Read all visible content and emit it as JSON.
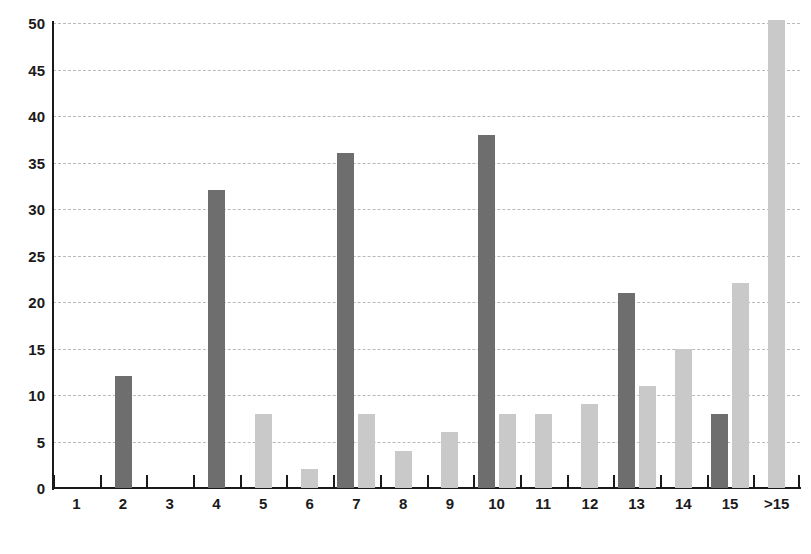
{
  "chart_data": {
    "type": "bar",
    "title": "",
    "subtitle": "",
    "xlabel": "",
    "ylabel": "",
    "xlim_categories": [
      "1",
      "2",
      "3",
      "4",
      "5",
      "6",
      "7",
      "8",
      "9",
      "10",
      "11",
      "12",
      "13",
      "14",
      "15",
      ">15"
    ],
    "ylim": [
      0,
      50
    ],
    "ytick_step": 5,
    "yticks": [
      0,
      5,
      10,
      15,
      20,
      25,
      30,
      35,
      40,
      45,
      50
    ],
    "ytick_labels": [
      "0",
      "5",
      "10",
      "15",
      "20",
      "25",
      "30",
      "35",
      "40",
      "45",
      "50"
    ],
    "grid": true,
    "grid_style": "dashed-horizontal",
    "legend": "none",
    "categories": [
      "1",
      "2",
      "3",
      "4",
      "5",
      "6",
      "7",
      "8",
      "9",
      "10",
      "11",
      "12",
      "13",
      "14",
      "15",
      ">15"
    ],
    "series": [
      {
        "name": "dark-series",
        "color": "#6e6e6e",
        "values": [
          0,
          12,
          0,
          32,
          0,
          0,
          36,
          0,
          0,
          38,
          0,
          0,
          21,
          0,
          8,
          0
        ]
      },
      {
        "name": "light-series",
        "color": "#c9c9c9",
        "values": [
          0,
          0,
          0,
          0,
          8,
          2,
          8,
          4,
          6,
          8,
          8,
          9,
          11,
          15,
          22,
          50
        ]
      }
    ],
    "notes": {
      "clipped_bars": [
        ">15"
      ],
      "clipped_note": "The '>15' light bar reaches the top of the plot (50) and is clipped."
    }
  },
  "axis": {
    "x_axis_name": "category-axis",
    "y_axis_name": "value-axis"
  }
}
